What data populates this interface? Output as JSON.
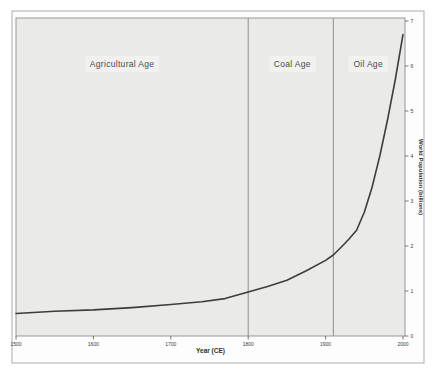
{
  "accent_colors": {
    "plot_background": "#eaeae8",
    "figure_background": "#fdfdfd",
    "curve_color": "#3d3d3d",
    "boundary_line_color": "#8f8f8f"
  },
  "chart_data": {
    "type": "line",
    "title": "",
    "xlabel": "Year (CE)",
    "ylabel": "World Population (billions)",
    "xlim": [
      1500,
      2005
    ],
    "ylim": [
      0,
      7
    ],
    "x_ticks": [
      1500,
      1600,
      1700,
      1800,
      1900,
      2000
    ],
    "y_ticks": [
      0,
      1,
      2,
      3,
      4,
      5,
      6,
      7
    ],
    "grid": false,
    "legend": "none",
    "series": [
      {
        "name": "World Population",
        "points": [
          [
            1500,
            0.5
          ],
          [
            1550,
            0.55
          ],
          [
            1600,
            0.58
          ],
          [
            1650,
            0.63
          ],
          [
            1700,
            0.7
          ],
          [
            1740,
            0.76
          ],
          [
            1770,
            0.83
          ],
          [
            1800,
            0.98
          ],
          [
            1825,
            1.1
          ],
          [
            1850,
            1.24
          ],
          [
            1875,
            1.45
          ],
          [
            1900,
            1.68
          ],
          [
            1910,
            1.8
          ],
          [
            1920,
            1.97
          ],
          [
            1930,
            2.15
          ],
          [
            1940,
            2.35
          ],
          [
            1945,
            2.55
          ],
          [
            1950,
            2.75
          ],
          [
            1960,
            3.3
          ],
          [
            1970,
            4.0
          ],
          [
            1980,
            4.8
          ],
          [
            1990,
            5.7
          ],
          [
            2000,
            6.7
          ]
        ]
      }
    ],
    "regions": [
      {
        "label": "Agricultural Age",
        "start": 1500,
        "end": 1800,
        "label_x_year": 1637
      },
      {
        "label": "Coal Age",
        "start": 1800,
        "end": 1910,
        "label_x_year": 1857
      },
      {
        "label": "Oil Age",
        "start": 1910,
        "end": 2005,
        "label_x_year": 1955
      }
    ],
    "boundary_years": [
      1800,
      1910
    ]
  }
}
